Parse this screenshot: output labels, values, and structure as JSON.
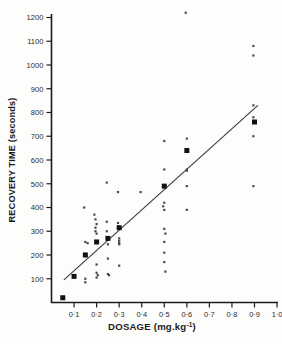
{
  "figure": {
    "background_color": "#fdfdfc",
    "ink_color": "#1c1c1c"
  },
  "axes": {
    "y_title": "RECOVERY  TIME  (seconds)",
    "x_title": "DOSAGE  (mg.kg",
    "x_title_exponent": "-1",
    "x_title_close": ")",
    "y_ticks": [
      "100",
      "200",
      "300",
      "400",
      "500",
      "600",
      "700",
      "800",
      "900",
      "1000",
      "1100",
      "1200"
    ],
    "x_ticks": [
      "0·1",
      "0·2",
      "0·3",
      "0·4",
      "0·5",
      "0·6",
      "0·7",
      "0·8",
      "0·9",
      "1·0"
    ]
  },
  "chart_data": {
    "type": "scatter",
    "title": "",
    "xlabel": "DOSAGE (mg.kg-1)",
    "ylabel": "RECOVERY TIME (seconds)",
    "xlim": [
      0.0,
      1.05
    ],
    "ylim": [
      0,
      1250
    ],
    "grid": false,
    "legend": "none",
    "x_tick_values": [
      0.1,
      0.2,
      0.3,
      0.4,
      0.5,
      0.6,
      0.7,
      0.8,
      0.9,
      1.0
    ],
    "y_tick_values": [
      100,
      200,
      300,
      400,
      500,
      600,
      700,
      800,
      900,
      1000,
      1100,
      1200
    ],
    "series": [
      {
        "name": "individual observations",
        "marker": "small-dot",
        "points": [
          [
            0.05,
            20
          ],
          [
            0.1,
            110
          ],
          [
            0.145,
            400
          ],
          [
            0.15,
            255
          ],
          [
            0.16,
            250
          ],
          [
            0.15,
            205
          ],
          [
            0.155,
            195
          ],
          [
            0.15,
            100
          ],
          [
            0.15,
            85
          ],
          [
            0.19,
            370
          ],
          [
            0.195,
            350
          ],
          [
            0.2,
            330
          ],
          [
            0.195,
            315
          ],
          [
            0.195,
            300
          ],
          [
            0.2,
            290
          ],
          [
            0.2,
            255
          ],
          [
            0.2,
            250
          ],
          [
            0.2,
            160
          ],
          [
            0.2,
            125
          ],
          [
            0.205,
            115
          ],
          [
            0.2,
            105
          ],
          [
            0.245,
            505
          ],
          [
            0.245,
            340
          ],
          [
            0.245,
            300
          ],
          [
            0.25,
            270
          ],
          [
            0.25,
            265
          ],
          [
            0.25,
            245
          ],
          [
            0.25,
            185
          ],
          [
            0.25,
            120
          ],
          [
            0.255,
            115
          ],
          [
            0.295,
            465
          ],
          [
            0.295,
            335
          ],
          [
            0.3,
            270
          ],
          [
            0.3,
            260
          ],
          [
            0.3,
            250
          ],
          [
            0.3,
            245
          ],
          [
            0.3,
            155
          ],
          [
            0.395,
            465
          ],
          [
            0.5,
            680
          ],
          [
            0.5,
            560
          ],
          [
            0.5,
            420
          ],
          [
            0.495,
            405
          ],
          [
            0.5,
            390
          ],
          [
            0.5,
            310
          ],
          [
            0.505,
            290
          ],
          [
            0.5,
            255
          ],
          [
            0.5,
            210
          ],
          [
            0.5,
            170
          ],
          [
            0.505,
            130
          ],
          [
            0.595,
            1220
          ],
          [
            0.6,
            690
          ],
          [
            0.6,
            560
          ],
          [
            0.6,
            555
          ],
          [
            0.6,
            490
          ],
          [
            0.6,
            390
          ],
          [
            0.895,
            1080
          ],
          [
            0.895,
            1040
          ],
          [
            0.895,
            830
          ],
          [
            0.895,
            780
          ],
          [
            0.895,
            700
          ],
          [
            0.895,
            490
          ]
        ]
      },
      {
        "name": "group means",
        "marker": "large-square",
        "points": [
          [
            0.05,
            20
          ],
          [
            0.1,
            110
          ],
          [
            0.15,
            200
          ],
          [
            0.2,
            255
          ],
          [
            0.25,
            270
          ],
          [
            0.3,
            315
          ],
          [
            0.5,
            490
          ],
          [
            0.6,
            640
          ],
          [
            0.9,
            760
          ]
        ]
      }
    ],
    "fit_line": {
      "label": "fitted regression line",
      "x_start": 0.055,
      "y_start": 95,
      "x_end": 0.915,
      "y_end": 830
    }
  }
}
